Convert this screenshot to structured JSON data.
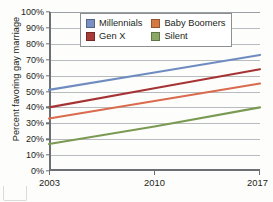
{
  "chart_data": {
    "type": "line",
    "title": "",
    "xlabel": "",
    "ylabel": "Percent favoring gay marriage",
    "x": [
      2003,
      2010,
      2017
    ],
    "xtick_labels": [
      "2003",
      "2010",
      "2017"
    ],
    "ytick_labels": [
      "0%",
      "10%",
      "20%",
      "30%",
      "40%",
      "50%",
      "60%",
      "70%",
      "80%",
      "90%",
      "100%"
    ],
    "ytick_values": [
      0,
      10,
      20,
      30,
      40,
      50,
      60,
      70,
      80,
      90,
      100
    ],
    "ylim": [
      0,
      100
    ],
    "xlim": [
      2003,
      2017
    ],
    "grid": "horizontal",
    "legend_position": "top-center",
    "series": [
      {
        "name": "Millennials",
        "color": "#6f8cc0",
        "values": [
          51,
          62,
          73
        ],
        "start_value": 51,
        "end_value": 73
      },
      {
        "name": "Baby Boomers",
        "color": "#d96b4e",
        "values": [
          33,
          44,
          55
        ],
        "start_value": 33,
        "end_value": 55
      },
      {
        "name": "Gen X",
        "color": "#a63334",
        "values": [
          40,
          52,
          64
        ],
        "start_value": 40,
        "end_value": 64
      },
      {
        "name": "Silent",
        "color": "#7a9a53",
        "values": [
          17,
          28,
          40
        ],
        "start_value": 17,
        "end_value": 40
      }
    ]
  },
  "legend": {
    "entries": [
      {
        "label": "Millennials",
        "color": "#7a90c2"
      },
      {
        "label": "Baby Boomers",
        "color": "#d4793f"
      },
      {
        "label": "Gen X",
        "color": "#a83a37"
      },
      {
        "label": "Silent",
        "color": "#88a864"
      }
    ]
  },
  "axes": {
    "y_title": "Percent favoring gay marriage",
    "axis_color": "#6d7073",
    "grid_color": "#b9bcbe"
  }
}
